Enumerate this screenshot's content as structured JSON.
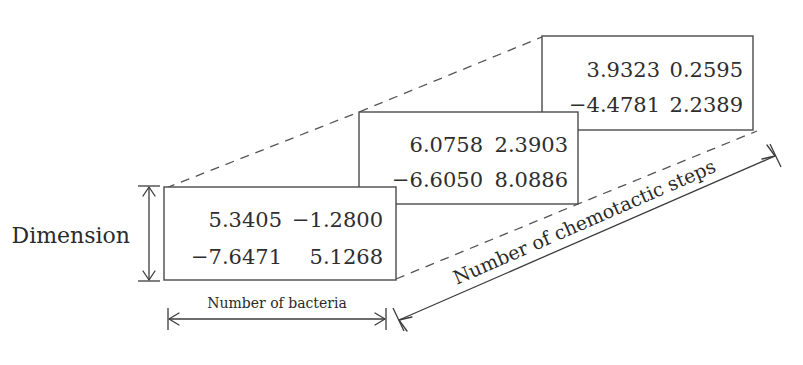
{
  "figure": {
    "background_color": "#ffffff",
    "ink_color": "#3c3c3c",
    "text_color": "#2e2e2e"
  },
  "axes": {
    "vertical": {
      "label": "Dimension",
      "name": "dimension-axis"
    },
    "horizontal": {
      "label": "Number of bacteria",
      "name": "bacteria-axis"
    },
    "depth": {
      "label": "Number of chemotactic steps",
      "name": "chemotactic-steps-axis"
    }
  },
  "matrices": [
    {
      "id": "front",
      "position": "front",
      "rows": [
        [
          "5.3405",
          "−1.2800"
        ],
        [
          "−7.6471",
          "5.1268"
        ]
      ]
    },
    {
      "id": "middle",
      "position": "middle",
      "rows": [
        [
          "6.0758",
          "2.3903"
        ],
        [
          "−6.6050",
          "8.0886"
        ]
      ]
    },
    {
      "id": "back",
      "position": "back",
      "rows": [
        [
          "3.9323",
          "0.2595"
        ],
        [
          "−4.4781",
          "2.2389"
        ]
      ]
    }
  ]
}
